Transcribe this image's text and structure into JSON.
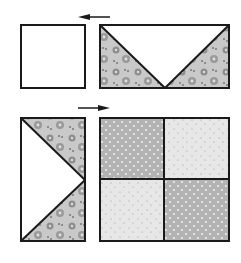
{
  "diagram": {
    "type": "quilt-block-assembly",
    "rows": [
      {
        "name": "top-row",
        "pieces": [
          "plain-square",
          "flying-geese-unit"
        ],
        "arrow_direction": "left"
      },
      {
        "name": "bottom-row",
        "pieces": [
          "flying-geese-unit-vertical",
          "four-patch"
        ],
        "arrow_direction": "right"
      }
    ],
    "colors": {
      "outline": "#1a1a1a",
      "background": "#ffffff",
      "floral_fabric": "#bdbdbd",
      "dark_dot_fabric": "#b0b0b0",
      "light_dot_fabric": "#e6e6e6",
      "plain_fabric": "#ffffff"
    }
  }
}
